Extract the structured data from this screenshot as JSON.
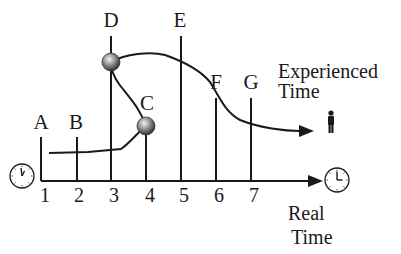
{
  "diagram": {
    "event_labels": [
      "A",
      "B",
      "C",
      "D",
      "E",
      "F",
      "G"
    ],
    "tick_labels": [
      "1",
      "2",
      "3",
      "4",
      "5",
      "6",
      "7"
    ],
    "experienced_time_label": [
      "Experienced",
      "Time"
    ],
    "real_time_label": [
      "Real",
      "Time"
    ],
    "icons": {
      "start_clock": "clock-icon",
      "end_clock": "clock-icon",
      "person": "person-icon",
      "event_node": "sphere-icon"
    },
    "colors": {
      "line": "#1a1a1a",
      "sphere_light": "#e8e8e8",
      "sphere_dark": "#4a4a4a",
      "background": "#ffffff"
    }
  }
}
